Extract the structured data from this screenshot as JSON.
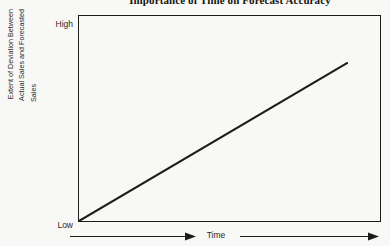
{
  "chart_data": {
    "type": "line",
    "title": "Importance of Time on Forecast Accuracy",
    "xlabel": "Time",
    "ylabel_lines": [
      "Extent of Deviation Between",
      "Actual Sales and Forecasted",
      "Sales"
    ],
    "ylabel": "Extent of Deviation Between Actual Sales and Forecasted Sales",
    "y_ticks": [
      "High",
      "Low"
    ],
    "y_tick_high": "High",
    "y_tick_low": "Low",
    "ylim": [
      0,
      1
    ],
    "xlim": [
      0,
      1
    ],
    "grid": false,
    "legend": false,
    "annotations": [],
    "series": [
      {
        "name": "Deviation vs Time",
        "x": [
          0.0,
          0.89
        ],
        "y": [
          0.0,
          0.77
        ],
        "style": "solid",
        "color": "#1c1c18"
      }
    ],
    "x_axis_arrow": "double-segment-right-arrow",
    "colors": {
      "line": "#1c1c18",
      "frame": "#1c1c18",
      "background": "#f8f8f6",
      "text": "#2a2a26",
      "title": "#15150f"
    }
  }
}
